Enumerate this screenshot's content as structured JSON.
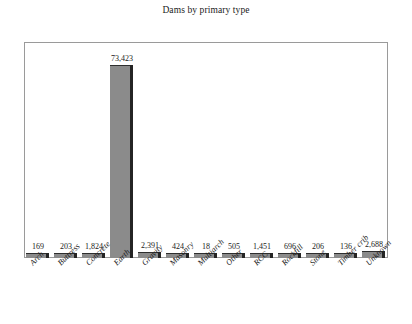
{
  "chart_data": {
    "type": "bar",
    "title": "Dams by primary type",
    "xlabel": "",
    "ylabel": "",
    "grid": false,
    "legend": false,
    "ylim": [
      0,
      82000
    ],
    "categories": [
      "Arch",
      "Buttress",
      "Concrete",
      "Earth",
      "Gravity",
      "Masonry",
      "Multiarch",
      "Other",
      "RCC",
      "Rockfill",
      "Stone",
      "Timber crib",
      "Unknown"
    ],
    "values": [
      169,
      203,
      1824,
      73423,
      2391,
      424,
      18,
      505,
      1451,
      696,
      206,
      136,
      2688
    ],
    "value_labels": [
      "169",
      "203",
      "1,824",
      "73,423",
      "2,391",
      "424",
      "18",
      "505",
      "1,451",
      "696",
      "206",
      "136",
      "2,688"
    ],
    "bar_color": "#8b8b8b",
    "bar_edge_color": "#242424",
    "frame_color": "#9a9a9a",
    "background_color": "#ffffff",
    "text_color": "#1a1a1a"
  }
}
